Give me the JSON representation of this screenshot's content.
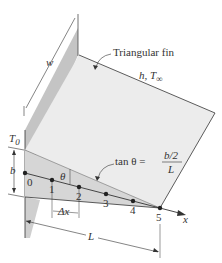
{
  "figure": {
    "labels": {
      "fin_name": "Triangular fin",
      "convection": "h, T",
      "convection_sub": "∞",
      "width": "w",
      "base_temp": "T",
      "base_temp_sub": "0",
      "thickness": "b",
      "angle": "θ",
      "step": "Δx",
      "length": "L",
      "axis": "x",
      "tan_lhs": "tan θ =",
      "tan_num": "b/2",
      "tan_den": "L"
    },
    "nodes": [
      "0",
      "1",
      "2",
      "3",
      "4",
      "5"
    ],
    "colors": {
      "fin_face": "#ececec",
      "fin_side": "#d9d9d9",
      "wall": "#bdbdbd",
      "line": "#333333"
    }
  }
}
